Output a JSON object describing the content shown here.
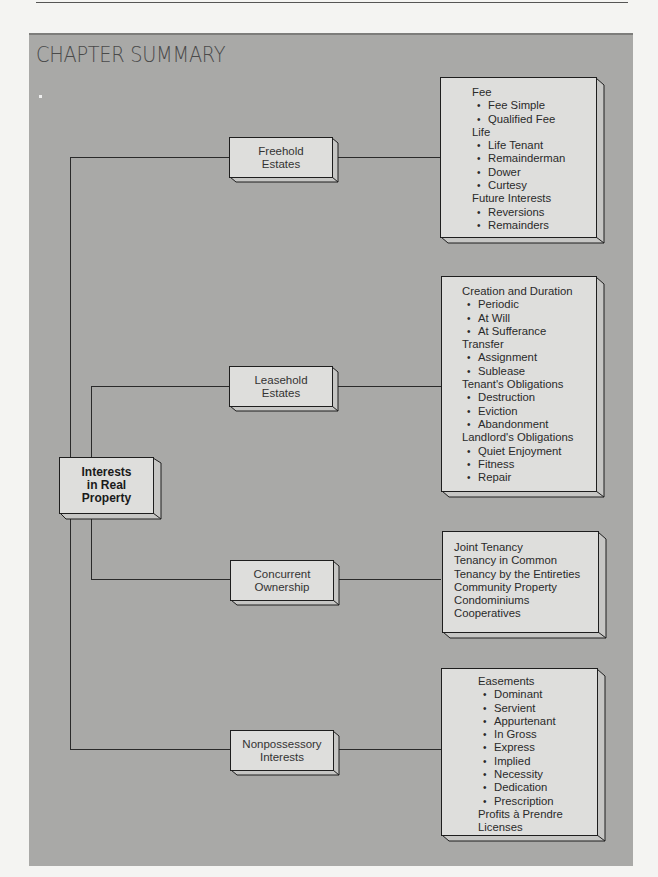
{
  "page": {
    "title": "CHAPTER SUMMARY",
    "colors": {
      "panel": "#a9a9a7",
      "box_face": "#dededc",
      "line": "#2a2a2a",
      "title": "#4a4a4a"
    }
  },
  "diagram": {
    "root": {
      "label_lines": [
        "Interests",
        "in Real",
        "Property"
      ]
    },
    "branches": [
      {
        "id": "freehold",
        "label_lines": [
          "Freehold",
          "Estates"
        ],
        "details": [
          {
            "type": "heading",
            "text": "Fee"
          },
          {
            "type": "bullet",
            "text": "Fee Simple"
          },
          {
            "type": "bullet",
            "text": "Qualified Fee"
          },
          {
            "type": "heading",
            "text": "Life"
          },
          {
            "type": "bullet",
            "text": "Life Tenant"
          },
          {
            "type": "bullet",
            "text": "Remainderman"
          },
          {
            "type": "bullet",
            "text": "Dower"
          },
          {
            "type": "bullet",
            "text": "Curtesy"
          },
          {
            "type": "heading",
            "text": "Future Interests"
          },
          {
            "type": "bullet",
            "text": "Reversions"
          },
          {
            "type": "bullet",
            "text": "Remainders"
          }
        ]
      },
      {
        "id": "leasehold",
        "label_lines": [
          "Leasehold",
          "Estates"
        ],
        "details": [
          {
            "type": "heading",
            "text": "Creation and Duration"
          },
          {
            "type": "bullet",
            "text": "Periodic"
          },
          {
            "type": "bullet",
            "text": "At Will"
          },
          {
            "type": "bullet",
            "text": "At Sufferance"
          },
          {
            "type": "heading",
            "text": "Transfer"
          },
          {
            "type": "bullet",
            "text": "Assignment"
          },
          {
            "type": "bullet",
            "text": "Sublease"
          },
          {
            "type": "heading",
            "text": "Tenant's Obligations"
          },
          {
            "type": "bullet",
            "text": "Destruction"
          },
          {
            "type": "bullet",
            "text": "Eviction"
          },
          {
            "type": "bullet",
            "text": "Abandonment"
          },
          {
            "type": "heading",
            "text": "Landlord's Obligations"
          },
          {
            "type": "bullet",
            "text": "Quiet Enjoyment"
          },
          {
            "type": "bullet",
            "text": "Fitness"
          },
          {
            "type": "bullet",
            "text": "Repair"
          }
        ]
      },
      {
        "id": "concurrent",
        "label_lines": [
          "Concurrent",
          "Ownership"
        ],
        "details": [
          {
            "type": "heading",
            "text": "Joint Tenancy"
          },
          {
            "type": "heading",
            "text": "Tenancy in Common"
          },
          {
            "type": "heading",
            "text": "Tenancy by the Entireties"
          },
          {
            "type": "heading",
            "text": "Community Property"
          },
          {
            "type": "heading",
            "text": "Condominiums"
          },
          {
            "type": "heading",
            "text": "Cooperatives"
          }
        ]
      },
      {
        "id": "nonpossessory",
        "label_lines": [
          "Nonpossessory",
          "Interests"
        ],
        "details": [
          {
            "type": "heading",
            "text": "Easements"
          },
          {
            "type": "bullet",
            "text": "Dominant"
          },
          {
            "type": "bullet",
            "text": "Servient"
          },
          {
            "type": "bullet",
            "text": "Appurtenant"
          },
          {
            "type": "bullet",
            "text": "In Gross"
          },
          {
            "type": "bullet",
            "text": "Express"
          },
          {
            "type": "bullet",
            "text": "Implied"
          },
          {
            "type": "bullet",
            "text": "Necessity"
          },
          {
            "type": "bullet",
            "text": "Dedication"
          },
          {
            "type": "bullet",
            "text": "Prescription"
          },
          {
            "type": "heading",
            "text": "Profits à Prendre"
          },
          {
            "type": "heading",
            "text": "Licenses"
          }
        ]
      }
    ]
  }
}
